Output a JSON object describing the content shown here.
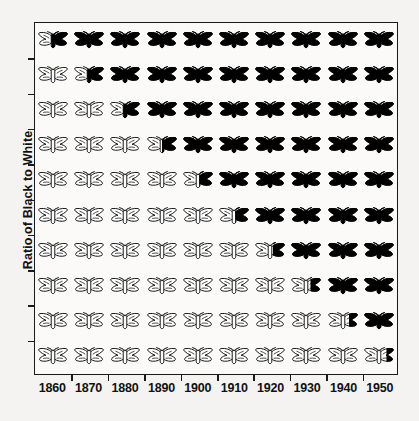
{
  "chart_data": {
    "type": "heatmap",
    "title": "",
    "xlabel": "",
    "ylabel": "Ratio of Black to White",
    "categories": [
      "1860",
      "1870",
      "1880",
      "1890",
      "1900",
      "1910",
      "1920",
      "1930",
      "1940",
      "1950"
    ],
    "x_tick_labels": [
      "1860",
      "1870",
      "1880",
      "1890",
      "1900",
      "1910",
      "1920",
      "1930",
      "1940",
      "1950"
    ],
    "y_tick_labels": [
      "",
      "",
      "",
      "",
      "",
      "",
      "",
      "",
      "",
      ""
    ],
    "grid": false,
    "legend": "none",
    "icon": "moth-icon",
    "icon_colors": {
      "black": "#000000",
      "white": "#ffffff",
      "outline": "#1a1a1a"
    },
    "rows": [
      {
        "row": 1,
        "values": [
          0.55,
          1,
          1,
          1,
          1,
          1,
          1,
          1,
          1,
          1
        ]
      },
      {
        "row": 2,
        "values": [
          0,
          0.55,
          1,
          1,
          1,
          1,
          1,
          1,
          1,
          1
        ]
      },
      {
        "row": 3,
        "values": [
          0,
          0,
          0.55,
          1,
          1,
          1,
          1,
          1,
          1,
          1
        ]
      },
      {
        "row": 4,
        "values": [
          0,
          0,
          0,
          0.5,
          1,
          1,
          1,
          1,
          1,
          1
        ]
      },
      {
        "row": 5,
        "values": [
          0,
          0,
          0,
          0,
          0.45,
          1,
          1,
          1,
          1,
          1
        ]
      },
      {
        "row": 6,
        "values": [
          0,
          0,
          0,
          0,
          0,
          0.45,
          1,
          1,
          1,
          1
        ]
      },
      {
        "row": 7,
        "values": [
          0,
          0,
          0,
          0,
          0,
          0,
          0.4,
          1,
          1,
          1
        ]
      },
      {
        "row": 8,
        "values": [
          0,
          0,
          0,
          0,
          0,
          0,
          0,
          0.35,
          1,
          1
        ]
      },
      {
        "row": 9,
        "values": [
          0,
          0,
          0,
          0,
          0,
          0,
          0,
          0,
          0.3,
          1
        ]
      },
      {
        "row": 10,
        "values": [
          0,
          0,
          0,
          0,
          0,
          0,
          0,
          0,
          0,
          0.25
        ]
      }
    ]
  }
}
